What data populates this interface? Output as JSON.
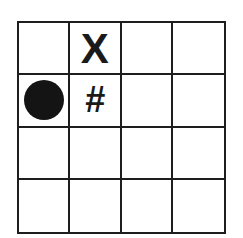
{
  "grid": {
    "rows": 4,
    "cols": 4,
    "line_color": "#1e1e1e",
    "background": "#ffffff",
    "cells": [
      [
        {
          "symbol": ""
        },
        {
          "symbol": "X"
        },
        {
          "symbol": ""
        },
        {
          "symbol": ""
        }
      ],
      [
        {
          "symbol": "filled-circle"
        },
        {
          "symbol": "#"
        },
        {
          "symbol": ""
        },
        {
          "symbol": ""
        }
      ],
      [
        {
          "symbol": ""
        },
        {
          "symbol": ""
        },
        {
          "symbol": ""
        },
        {
          "symbol": ""
        }
      ],
      [
        {
          "symbol": ""
        },
        {
          "symbol": ""
        },
        {
          "symbol": ""
        },
        {
          "symbol": ""
        }
      ]
    ]
  },
  "labels": {
    "x_mark": "X",
    "hash_mark": "#"
  }
}
